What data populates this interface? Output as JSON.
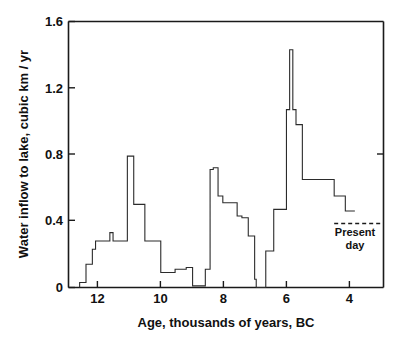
{
  "chart_data": {
    "type": "line",
    "variant": "step",
    "title": "",
    "xlabel": "Age, thousands of years, BC",
    "ylabel": "Water inflow to lake, cubic km / yr",
    "xlim": [
      12.9,
      3.0
    ],
    "ylim": [
      0,
      1.6
    ],
    "x_inverted": true,
    "grid": false,
    "legend": null,
    "xticks": [
      12,
      10,
      8,
      6,
      4
    ],
    "xtick_labels": [
      "12",
      "10",
      "8",
      "6",
      "4"
    ],
    "yticks": [
      0,
      0.4,
      0.8,
      1.2,
      1.6
    ],
    "ytick_labels": [
      "0",
      "0.4",
      "0.8",
      "1.2",
      "1.6"
    ],
    "series": [
      {
        "name": "Water inflow to lake",
        "x": [
          12.55,
          12.55,
          12.45,
          12.35,
          12.25,
          12.15,
          12.05,
          11.85,
          11.6,
          11.5,
          11.25,
          11.05,
          10.85,
          10.5,
          10.2,
          10.0,
          9.75,
          9.55,
          9.35,
          9.2,
          9.0,
          8.8,
          8.6,
          8.5,
          8.45,
          8.35,
          8.2,
          8.05,
          7.85,
          7.6,
          7.45,
          7.25,
          7.05,
          7.0,
          6.75,
          6.7,
          6.45,
          6.2,
          6.05,
          5.95,
          5.85,
          5.75,
          5.55,
          5.3,
          4.9,
          4.55,
          4.2,
          3.9
        ],
        "y": [
          0.0,
          0.03,
          0.03,
          0.14,
          0.14,
          0.23,
          0.28,
          0.28,
          0.33,
          0.28,
          0.28,
          0.79,
          0.5,
          0.28,
          0.28,
          0.09,
          0.09,
          0.11,
          0.11,
          0.12,
          0.01,
          0.01,
          0.11,
          0.11,
          0.71,
          0.72,
          0.55,
          0.51,
          0.51,
          0.43,
          0.42,
          0.31,
          0.05,
          0.0,
          0.0,
          0.22,
          0.47,
          0.47,
          1.07,
          1.43,
          1.07,
          0.98,
          0.65,
          0.65,
          0.65,
          0.55,
          0.46,
          0.46
        ],
        "stepped": true
      }
    ],
    "annotations": [
      {
        "name": "present-day",
        "label_line1": "Present",
        "label_line2": "day",
        "reference_line_value": 0.385,
        "reference_line_x_start": 4.55,
        "reference_line_x_end": 3.1,
        "style": "dashed"
      }
    ]
  },
  "axes": {
    "y_axis_title": "Water inflow to lake, cubic km / yr",
    "x_axis_title": "Age, thousands of years, BC"
  },
  "tick_text": {
    "y": [
      "1.6",
      "1.2",
      "0.8",
      "0.4",
      "0"
    ],
    "x": [
      "12",
      "10",
      "8",
      "6",
      "4"
    ]
  },
  "annotation_text": {
    "present_day_line1": "Present",
    "present_day_line2": "day"
  },
  "colors": {
    "background": "#ffffff",
    "axis": "#1a1a1a",
    "data_line": "#2b2b2b",
    "text": "#111111"
  }
}
